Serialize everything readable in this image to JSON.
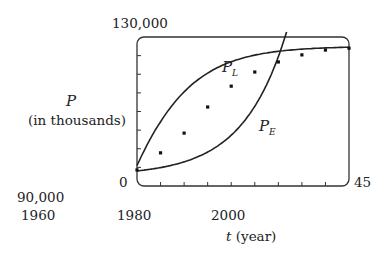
{
  "chart_data": {
    "type": "line",
    "title": "",
    "xlabel": "t (year)",
    "ylabel": "P (in thousands)",
    "ylabel_var": "P",
    "ylabel_unit": "(in thousands)",
    "xlabel_var": "t",
    "xlabel_unit": "(year)",
    "xlim": [
      0,
      45
    ],
    "ylim": [
      90000,
      130000
    ],
    "window_corner_labels": {
      "y_top": "130,000",
      "x_left": "0",
      "y_bottom": "90,000",
      "x_right": "45"
    },
    "x_ticks": [
      "1960",
      "1980",
      "2000"
    ],
    "x_tick_years": [
      1960,
      1980,
      2000
    ],
    "grid": false,
    "series": [
      {
        "name": "Data points",
        "kind": "scatter",
        "x": [
          1960,
          1965,
          1970,
          1975,
          1980,
          1985,
          1990,
          1995,
          2000,
          2005
        ],
        "values": [
          94.3,
          98.9,
          104.2,
          111.2,
          116.8,
          120.6,
          123.3,
          125.2,
          126.5,
          127.0
        ]
      },
      {
        "name": "P_L",
        "label": "P",
        "subscript": "L",
        "kind": "logistic curve",
        "x": [
          1960,
          1965,
          1970,
          1975,
          1980,
          1985,
          1990,
          1995,
          2000,
          2005
        ],
        "values": [
          96.0,
          99.6,
          104.6,
          110.6,
          116.1,
          120.2,
          123.0,
          124.8,
          125.9,
          126.6
        ]
      },
      {
        "name": "P_E",
        "label": "P",
        "subscript": "E",
        "kind": "exponential curve",
        "x": [
          1960,
          1965,
          1970,
          1975,
          1980,
          1985,
          1990,
          1995
        ],
        "values": [
          94.0,
          95.0,
          96.9,
          100.0,
          104.5,
          111.0,
          119.5,
          130.0
        ]
      }
    ]
  },
  "labels": {
    "y_top": "130,000",
    "y_var": "P",
    "y_unit": "(in thousands)",
    "x_zero": "0",
    "y_bottom": "90,000",
    "x_right": "45",
    "x_tick_1960": "1960",
    "x_tick_1980": "1980",
    "x_tick_2000": "2000",
    "x_var": "t",
    "x_unit": "(year)",
    "pl_main": "P",
    "pl_sub": "L",
    "pe_main": "P",
    "pe_sub": "E"
  }
}
